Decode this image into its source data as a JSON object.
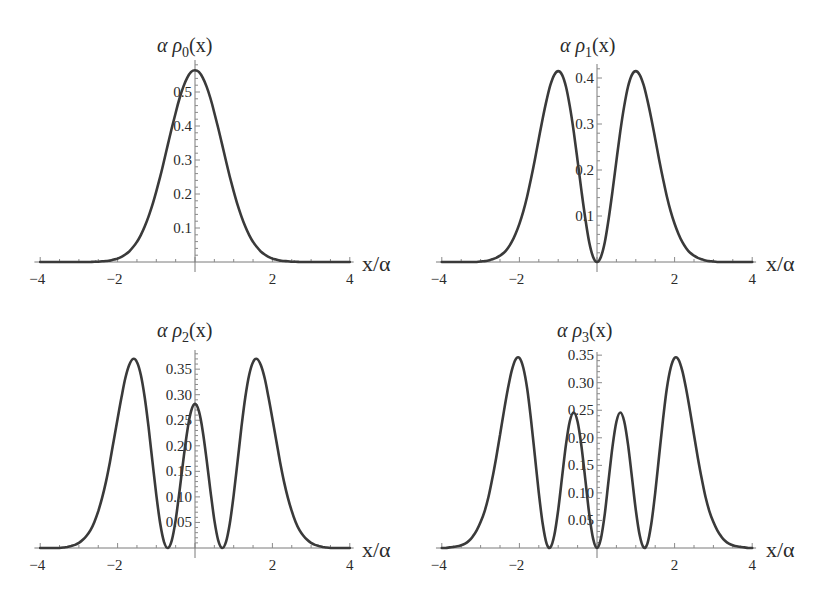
{
  "figure": {
    "panels": [
      {
        "title": "α ρ0(x)",
        "title_main": "α ρ",
        "title_sub": "0",
        "title_tail": "(x)",
        "xlabel": "x/α"
      },
      {
        "title": "α ρ1(x)",
        "title_main": "α ρ",
        "title_sub": "1",
        "title_tail": "(x)",
        "xlabel": "x/α"
      },
      {
        "title": "α ρ2(x)",
        "title_main": "α ρ",
        "title_sub": "2",
        "title_tail": "(x)",
        "xlabel": "x/α"
      },
      {
        "title": "α ρ3(x)",
        "title_main": "α ρ",
        "title_sub": "3",
        "title_tail": "(x)",
        "xlabel": "x/α"
      }
    ],
    "colors": {
      "curve": "#3a3a3a",
      "axis": "#7a7a7a",
      "text": "#2a2a2a",
      "background": "#ffffff"
    }
  },
  "chart_data": [
    {
      "type": "line",
      "title": "α ρ0(x)",
      "xlabel": "x/α",
      "ylabel": "α ρ0(x)",
      "xlim": [
        -4,
        4
      ],
      "ylim": [
        0,
        0.57
      ],
      "xticks": [
        -4,
        -2,
        2,
        4
      ],
      "yticks": [
        0.1,
        0.2,
        0.3,
        0.4,
        0.5
      ],
      "ytick_labels": [
        "0.1",
        "0.2",
        "0.3",
        "0.4",
        "0.5"
      ],
      "grid": false,
      "symmetric": true,
      "x_half": [
        0,
        0.1,
        0.2,
        0.3,
        0.4,
        0.5,
        0.6,
        0.7,
        0.8,
        0.9,
        1.0,
        1.1,
        1.2,
        1.3,
        1.4,
        1.5,
        1.6,
        1.7,
        1.8,
        1.9,
        2.0,
        2.1,
        2.2,
        2.3,
        2.4,
        2.5,
        2.6,
        2.7,
        2.8,
        2.9,
        3.0,
        3.1,
        3.2,
        3.3,
        3.4,
        3.5,
        3.6,
        3.7,
        3.8,
        3.9,
        4.0
      ],
      "y_half": [
        0.564,
        0.559,
        0.542,
        0.516,
        0.481,
        0.439,
        0.394,
        0.346,
        0.297,
        0.251,
        0.208,
        0.168,
        0.134,
        0.104,
        0.079,
        0.059,
        0.044,
        0.031,
        0.022,
        0.015,
        0.01,
        0.007,
        0.004,
        0.003,
        0.002,
        0.001,
        0.001,
        0,
        0,
        0,
        0,
        0,
        0,
        0,
        0,
        0,
        0,
        0,
        0,
        0,
        0
      ]
    },
    {
      "type": "line",
      "title": "α ρ1(x)",
      "xlabel": "x/α",
      "ylabel": "α ρ1(x)",
      "xlim": [
        -4,
        4
      ],
      "ylim": [
        0,
        0.42
      ],
      "xticks": [
        -4,
        -2,
        2,
        4
      ],
      "yticks": [
        0.1,
        0.2,
        0.3,
        0.4
      ],
      "ytick_labels": [
        "0.1",
        "0.2",
        "0.3",
        "0.4"
      ],
      "grid": false,
      "symmetric": true,
      "x_half": [
        0,
        0.1,
        0.2,
        0.3,
        0.4,
        0.5,
        0.6,
        0.7,
        0.8,
        0.9,
        1.0,
        1.1,
        1.2,
        1.3,
        1.4,
        1.5,
        1.6,
        1.7,
        1.8,
        1.9,
        2.0,
        2.1,
        2.2,
        2.3,
        2.4,
        2.5,
        2.6,
        2.7,
        2.8,
        2.9,
        3.0,
        3.1,
        3.2,
        3.3,
        3.4,
        3.5,
        3.6,
        3.7,
        3.8,
        3.9,
        4.0
      ],
      "y_half": [
        0,
        0.011,
        0.043,
        0.093,
        0.154,
        0.22,
        0.284,
        0.339,
        0.381,
        0.407,
        0.415,
        0.407,
        0.385,
        0.352,
        0.312,
        0.268,
        0.223,
        0.181,
        0.143,
        0.11,
        0.083,
        0.061,
        0.043,
        0.03,
        0.02,
        0.014,
        0.009,
        0.006,
        0.003,
        0.002,
        0.001,
        0,
        0,
        0,
        0,
        0,
        0,
        0,
        0,
        0,
        0
      ]
    },
    {
      "type": "line",
      "title": "α ρ2(x)",
      "xlabel": "x/α",
      "ylabel": "α ρ2(x)",
      "xlim": [
        -4,
        4
      ],
      "ylim": [
        0,
        0.38
      ],
      "xticks": [
        -4,
        -2,
        2,
        4
      ],
      "yticks": [
        0.05,
        0.1,
        0.15,
        0.2,
        0.25,
        0.3,
        0.35
      ],
      "ytick_labels": [
        "0.05",
        "0.10",
        "0.15",
        "0.20",
        "0.25",
        "0.30",
        "0.35"
      ],
      "grid": false,
      "symmetric": true,
      "x_half": [
        0,
        0.1,
        0.2,
        0.3,
        0.4,
        0.5,
        0.6,
        0.7,
        0.8,
        0.9,
        1.0,
        1.1,
        1.2,
        1.3,
        1.4,
        1.5,
        1.6,
        1.7,
        1.8,
        1.9,
        2.0,
        2.1,
        2.2,
        2.3,
        2.4,
        2.5,
        2.6,
        2.7,
        2.8,
        2.9,
        3.0,
        3.1,
        3.2,
        3.3,
        3.4,
        3.5,
        3.6,
        3.7,
        3.8,
        3.9,
        4.0
      ],
      "y_half": [
        0.282,
        0.268,
        0.229,
        0.173,
        0.111,
        0.055,
        0.015,
        0.0,
        0.012,
        0.048,
        0.104,
        0.17,
        0.236,
        0.295,
        0.339,
        0.364,
        0.37,
        0.358,
        0.332,
        0.295,
        0.253,
        0.21,
        0.168,
        0.13,
        0.098,
        0.072,
        0.051,
        0.035,
        0.024,
        0.016,
        0.01,
        0.006,
        0.004,
        0.002,
        0.001,
        0,
        0,
        0,
        0,
        0,
        0
      ]
    },
    {
      "type": "line",
      "title": "α ρ3(x)",
      "xlabel": "x/α",
      "ylabel": "α ρ3(x)",
      "xlim": [
        -4,
        4
      ],
      "ylim": [
        0,
        0.35
      ],
      "xticks": [
        -4,
        -2,
        2,
        4
      ],
      "yticks": [
        0.05,
        0.1,
        0.15,
        0.2,
        0.25,
        0.3,
        0.35
      ],
      "ytick_labels": [
        "0.05",
        "0.10",
        "0.15",
        "0.20",
        "0.25",
        "0.30",
        "0.35"
      ],
      "grid": false,
      "symmetric": true,
      "x_half": [
        0,
        0.1,
        0.2,
        0.3,
        0.4,
        0.5,
        0.6,
        0.7,
        0.8,
        0.9,
        1.0,
        1.1,
        1.2,
        1.3,
        1.4,
        1.5,
        1.6,
        1.7,
        1.8,
        1.9,
        2.0,
        2.1,
        2.2,
        2.3,
        2.4,
        2.5,
        2.6,
        2.7,
        2.8,
        2.9,
        3.0,
        3.1,
        3.2,
        3.3,
        3.4,
        3.5,
        3.6,
        3.7,
        3.8,
        3.9,
        4.0
      ],
      "y_half": [
        0,
        0.017,
        0.062,
        0.123,
        0.184,
        0.229,
        0.246,
        0.23,
        0.188,
        0.129,
        0.069,
        0.023,
        0.001,
        0.008,
        0.044,
        0.1,
        0.167,
        0.233,
        0.289,
        0.327,
        0.345,
        0.342,
        0.321,
        0.288,
        0.248,
        0.205,
        0.163,
        0.125,
        0.092,
        0.066,
        0.047,
        0.032,
        0.021,
        0.013,
        0.008,
        0.005,
        0.003,
        0.002,
        0.001,
        0,
        0
      ]
    }
  ]
}
